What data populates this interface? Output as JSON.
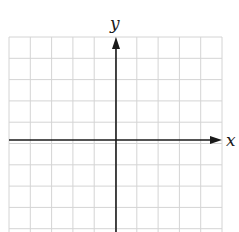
{
  "diagram": {
    "type": "coordinate-plane",
    "x_axis_label": "x",
    "y_axis_label": "y",
    "grid": {
      "columns": 10,
      "rows": 10,
      "left": 9,
      "top": 37,
      "cell": 21.3,
      "line_color": "#d4d4d4"
    },
    "axes": {
      "origin_x": 116,
      "origin_y": 140,
      "color": "#1a1a1a"
    }
  }
}
